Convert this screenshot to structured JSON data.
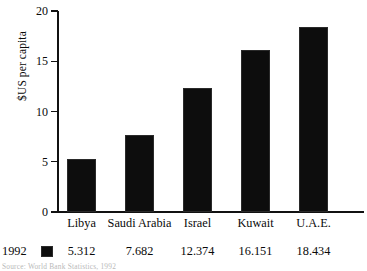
{
  "chart_data": {
    "type": "bar",
    "title": "",
    "xlabel": "",
    "ylabel": "$US per capita",
    "categories": [
      "Libya",
      "Saudi Arabia",
      "Israel",
      "Kuwait",
      "U.A.E."
    ],
    "values": [
      5.312,
      7.682,
      12.374,
      16.151,
      18.434
    ],
    "value_labels": [
      "5.312",
      "7.682",
      "12.374",
      "16.151",
      "18.434"
    ],
    "series": [
      {
        "name": "1992",
        "values": [
          5.312,
          7.682,
          12.374,
          16.151,
          18.434
        ],
        "color": "#0d0d0d"
      }
    ],
    "ylim": [
      0,
      20
    ],
    "yticks": [
      0,
      5,
      10,
      15,
      20
    ],
    "ytick_labels": [
      "0",
      "5",
      "10",
      "15",
      "20"
    ],
    "grid": false,
    "legend_position": "below-axis-table",
    "bar_color": "#0d0d0d",
    "axis_color": "#111111"
  },
  "legend": {
    "year_label": "1992",
    "swatch_color": "#0d0d0d"
  },
  "footer": {
    "source": "Source: World Bank Statistics, 1992"
  }
}
